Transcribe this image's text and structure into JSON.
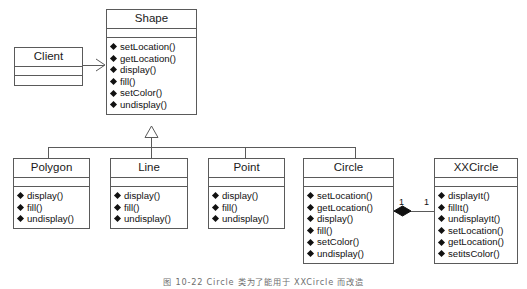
{
  "diagram": {
    "type": "uml-class-diagram",
    "line_color": "#5a5a5a",
    "text_color": "#1a1a1a",
    "background": "#ffffff"
  },
  "classes": {
    "client": {
      "name": "Client",
      "operations": [],
      "attributes": []
    },
    "shape": {
      "name": "Shape",
      "operations": [
        "setLocation()",
        "getLocation()",
        "display()",
        "fill()",
        "setColor()",
        "undisplay()"
      ]
    },
    "polygon": {
      "name": "Polygon",
      "operations": [
        "display()",
        "fill()",
        "undisplay()"
      ]
    },
    "line": {
      "name": "Line",
      "operations": [
        "display()",
        "fill()",
        "undisplay()"
      ]
    },
    "point": {
      "name": "Point",
      "operations": [
        "display()",
        "fill()",
        "undisplay()"
      ]
    },
    "circle": {
      "name": "Circle",
      "operations": [
        "setLocation()",
        "getLocation()",
        "display()",
        "fill()",
        "setColor()",
        "undisplay()"
      ]
    },
    "xxcircle": {
      "name": "XXCircle",
      "operations": [
        "displayIt()",
        "fillIt()",
        "undisplayIt()",
        "setLocation()",
        "getLocation()",
        "setitsColor()"
      ]
    }
  },
  "relationships": {
    "client_to_shape": {
      "kind": "association",
      "arrow": "open-arrow",
      "from": "Client",
      "to": "Shape"
    },
    "generalization": {
      "kind": "generalization",
      "arrow": "hollow-triangle",
      "parent": "Shape",
      "children": [
        "Polygon",
        "Line",
        "Point",
        "Circle"
      ]
    },
    "circle_to_xxcircle": {
      "kind": "composition",
      "arrow": "filled-diamond",
      "from": "Circle",
      "to": "XXCircle",
      "source_multiplicity": "1",
      "target_multiplicity": "1"
    }
  },
  "caption": {
    "text": "图 10-22    Circle 类为了能用于 XXCircle 而改造"
  }
}
